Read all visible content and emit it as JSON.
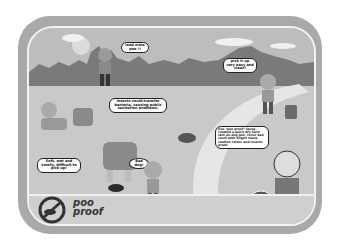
{
  "poster": {
    "title": "poo proof",
    "colors": {
      "frame": "#a9a9a9",
      "frame_border": "#f2f2f2",
      "sky": "#bdbdbd",
      "mountains": "#7a7a7a",
      "ground": "#c9c9c9",
      "path": "#e6e6e6",
      "bottom_strip": "#cfcfcf"
    }
  },
  "bubbles": {
    "runner": "Ieed mine poo !!",
    "insects": "Insects could transfer bacteria, causing public sanitation problems.",
    "girl": "pick it up very easy and clean!",
    "kid_left": "Soft, wet and smelly, difficult to pick up!",
    "bad_dog": "Bad dog!",
    "spray_man": "Use \"poo proof\" Spray - created a quick dry hard skin on dog poo, cover bad smell with bright sharp caution colour and insects proof."
  },
  "logo": {
    "text_line1": "poo",
    "text_line2": "proof",
    "icon": "no-dog-poo-icon"
  }
}
